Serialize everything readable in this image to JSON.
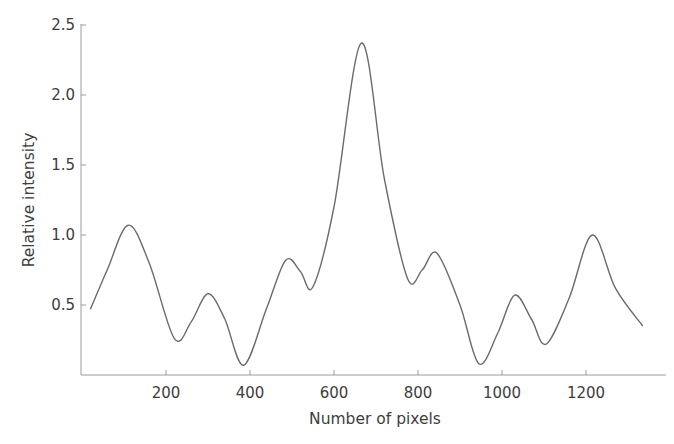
{
  "chart_data": {
    "type": "line",
    "title": "",
    "xlabel": "Number of pixels",
    "ylabel": "Relative intensity",
    "xlim": [
      0,
      1400
    ],
    "ylim": [
      0,
      2.5
    ],
    "x_ticks": [
      200,
      400,
      600,
      800,
      1000,
      1200
    ],
    "x_tick_labels": [
      "200",
      "400",
      "600",
      "800",
      "1000",
      "1200"
    ],
    "y_ticks": [
      0.5,
      1.0,
      1.5,
      2.0,
      2.5
    ],
    "y_tick_labels": [
      "0.5",
      "1.0",
      "1.5",
      "2.0",
      "2.5"
    ],
    "grid": false,
    "legend": null,
    "line_color": "#6b6b6b",
    "series": [
      {
        "name": "Relative intensity",
        "x": [
          20,
          60,
          110,
          160,
          220,
          260,
          300,
          340,
          385,
          440,
          485,
          520,
          550,
          600,
          665,
          720,
          775,
          810,
          845,
          900,
          945,
          990,
          1030,
          1070,
          1105,
          1160,
          1215,
          1270,
          1335
        ],
        "values": [
          0.47,
          0.75,
          1.07,
          0.8,
          0.26,
          0.38,
          0.58,
          0.4,
          0.07,
          0.48,
          0.82,
          0.74,
          0.63,
          1.2,
          2.37,
          1.4,
          0.69,
          0.75,
          0.87,
          0.5,
          0.08,
          0.3,
          0.57,
          0.4,
          0.22,
          0.55,
          1.0,
          0.62,
          0.35
        ]
      }
    ]
  }
}
